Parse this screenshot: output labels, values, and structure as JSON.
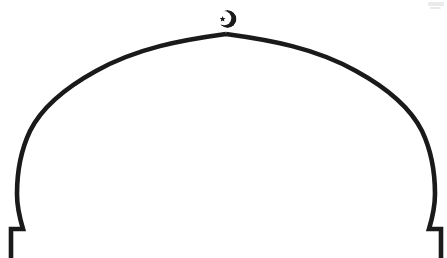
{
  "figure": {
    "title": "Ogee dome outline",
    "style": "line-art-outline",
    "background_color": "#ffffff",
    "stroke_color": "#1a1a1a",
    "stroke_width_px": 4.6,
    "canvas": {
      "width_px": 447,
      "height_px": 258
    },
    "symmetry": {
      "type": "bilateral-vertical",
      "axis_x_px": 226
    },
    "apex": {
      "x_px": 226,
      "y_px": 34,
      "shape": "sharp-point"
    },
    "widest_extent": {
      "left_x_px": 17,
      "right_x_px": 434,
      "at_y_px": 172
    },
    "base": {
      "y_px": 258,
      "left_step_outer_x_px": 11,
      "left_step_inner_x_px": 23,
      "right_step_inner_x_px": 425,
      "right_step_outer_x_px": 437,
      "step_shoulder_y_px": 229
    },
    "finial": {
      "name": "crescent-and-star",
      "center_x_px": 227,
      "center_y_px": 19,
      "outer_radius_px": 9,
      "crescent_color": "#1a1a1a",
      "star_points": 5,
      "star_radius_px": 2.6
    },
    "artifact": {
      "name": "scan-smudge",
      "x_px": 428,
      "y_px": 2,
      "width_px": 16,
      "height_px": 5
    }
  },
  "paths": {
    "dome_outline_d": "M 11 258 L 11 229 L 23 229 C 23 229 17 215 17 196 C 17 176 20 158 29 139 C 40 116 62 96 92 77 C 131 53 182 40 226 34 L 226 34 C 270 40 321 53 360 77 C 390 96 411 116 422 139 C 431 158 434 176 434 196 C 434 215 428 229 428 229 L 437 229 L 437 258",
    "left_half_note": "ogee: concave near base, inflection near y=150, convex sweep to apex",
    "right_half_note": "mirror of left half about x=226"
  },
  "labels": {
    "figure_label": "",
    "caption": ""
  }
}
